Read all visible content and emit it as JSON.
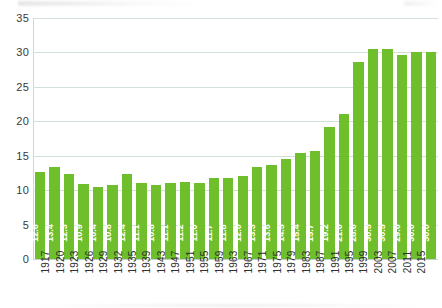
{
  "chart_data": {
    "type": "bar",
    "title": "",
    "subtitle": "",
    "xlabel": "",
    "ylabel": "",
    "ylim": [
      0,
      35
    ],
    "y_ticks": [
      0,
      5,
      10,
      15,
      20,
      25,
      30,
      35
    ],
    "y_tick_labels": [
      "0",
      "5",
      "10",
      "15",
      "20",
      "25",
      "30",
      "35"
    ],
    "grid": true,
    "legend": "none",
    "bar_color": "#6fbe2b",
    "value_label_color": "#ffffff",
    "gridline_color": "#d3e0d8",
    "categories": [
      "1917",
      "1920",
      "1923",
      "1926",
      "1929",
      "1932",
      "1935",
      "1939",
      "1943",
      "1947",
      "1951",
      "1955",
      "1959",
      "1963",
      "1967",
      "1971",
      "1975",
      "1979",
      "1983",
      "1987",
      "1991",
      "1995",
      "1999",
      "2003",
      "2007",
      "2011",
      "2015",
      "2015"
    ],
    "values": [
      12.6,
      13.4,
      12.3,
      10.9,
      10.4,
      10.8,
      12.4,
      11.1,
      10.8,
      11.1,
      11.2,
      11.0,
      11.7,
      11.8,
      12.0,
      13.3,
      13.6,
      14.5,
      15.4,
      15.7,
      19.2,
      21.0,
      28.6,
      30.5,
      30.5,
      29.6,
      30.0,
      30.0
    ],
    "value_labels": [
      "12.6",
      "13.4",
      "12.3",
      "10.9",
      "10.4",
      "10.8",
      "12.4",
      "11.1",
      "10.8",
      "11.1",
      "11.2",
      "11.0",
      "11.7",
      "11.8",
      "12.0",
      "13.3",
      "13.6",
      "14.5",
      "15.4",
      "15.7",
      "19.2",
      "21.0",
      "28.6",
      "30.5",
      "30.5",
      "29.6",
      "30.0",
      "30.0"
    ],
    "x_tick_labels": [
      "1917",
      "1920",
      "1923",
      "1926",
      "1929",
      "1932",
      "1935",
      "1939",
      "1943",
      "1947",
      "1951",
      "1955",
      "1959",
      "1963",
      "1967",
      "1971",
      "1975",
      "1979",
      "1983",
      "1987",
      "1991",
      "1995",
      "1999",
      "2003",
      "2007",
      "2011",
      "2015"
    ]
  }
}
